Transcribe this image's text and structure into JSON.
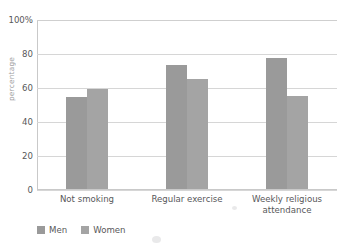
{
  "chart_data": {
    "type": "bar",
    "title": "",
    "subtitle": "",
    "xlabel": "",
    "ylabel": "",
    "categories": [
      "Not smoking",
      "Regular exercise",
      "Weekly religious attendance"
    ],
    "series": [
      {
        "name": "Men",
        "values": [
          54,
          73,
          77
        ],
        "color": "#9a9a9a"
      },
      {
        "name": "Women",
        "values": [
          59,
          65,
          55
        ],
        "color": "#a4a4a4"
      }
    ],
    "ylim": [
      0,
      100
    ],
    "yticks": [
      0,
      20,
      40,
      60,
      80,
      100
    ],
    "ytick_labels": [
      "0",
      "20",
      "40",
      "60",
      "80",
      "100%"
    ],
    "grid": true,
    "grid_axis": "y",
    "legend_position": "bottom-left",
    "bar_style": "grouped",
    "value_unit": "percent"
  },
  "axis": {
    "y_title_cropped": "percentage"
  },
  "legend": {
    "entries": [
      {
        "label": "Men"
      },
      {
        "label": "Women"
      }
    ]
  }
}
